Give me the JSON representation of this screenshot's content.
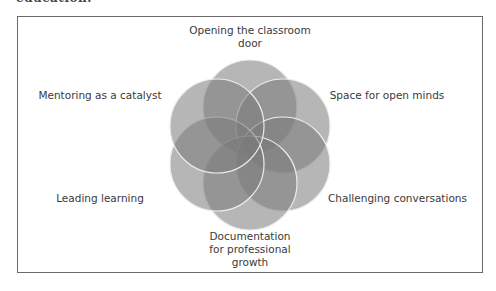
{
  "page": {
    "cut_off_text": "education."
  },
  "diagram": {
    "type": "six-circle overlapping flower (Venn-style)",
    "center": [
      250,
      145
    ],
    "circle_radius": 47,
    "center_offset": 38,
    "circle_fill": "#7a7a7a",
    "circle_opacity": 0.55,
    "circle_stroke": "#e9e9e9",
    "labels": {
      "top": "Opening the classroom door",
      "top_line1": "Opening the classroom",
      "top_line2": "door",
      "upper_right": "Space for open minds",
      "lower_right": "Challenging conversations",
      "bottom": "Documentation for professional growth",
      "bottom_line1": "Documentation",
      "bottom_line2": "for professional",
      "bottom_line3": "growth",
      "lower_left": "Leading learning",
      "upper_left": "Mentoring as a catalyst"
    }
  }
}
